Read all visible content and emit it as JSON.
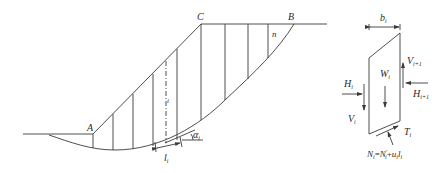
{
  "figure": {
    "slope": {
      "point_labels": {
        "A": "A",
        "B": "B",
        "C": "C"
      },
      "slice_labels": {
        "last": "n",
        "current": "i"
      },
      "base_length_label": {
        "main": "l",
        "sub": "i"
      },
      "base_angle_label": {
        "main": "α",
        "sub": "i"
      }
    },
    "free_body": {
      "width_label": {
        "main": "b",
        "sub": "i"
      },
      "weight_label": {
        "main": "W",
        "sub": "i"
      },
      "left_horizontal_force": {
        "main": "H",
        "sub": "i"
      },
      "right_horizontal_force": {
        "main": "H",
        "sub": "i+1"
      },
      "left_vertical_force": {
        "main": "V",
        "sub": "i"
      },
      "right_vertical_force": {
        "main": "V",
        "sub": "i+1"
      },
      "shear_force": {
        "main": "T",
        "sub": "i"
      },
      "normal_force_equation": {
        "lhs_main": "N",
        "lhs_sub": "i",
        "eq": "=",
        "rhs1_main": "N",
        "rhs1_sub": "i",
        "rhs1_sup": "′",
        "plus": "+",
        "rhs2_main": "u",
        "rhs2_sub": "i",
        "rhs3_main": "l",
        "rhs3_sub": "i"
      }
    }
  }
}
